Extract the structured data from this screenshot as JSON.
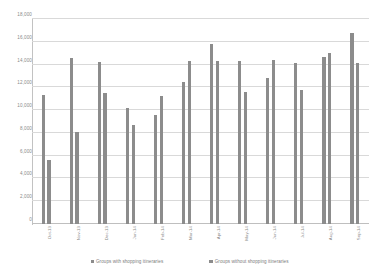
{
  "chart_data": {
    "type": "bar",
    "title": "",
    "xlabel": "",
    "ylabel": "",
    "ylim": [
      0,
      18000
    ],
    "ytick_step": 2000,
    "grid": true,
    "legend_position": "bottom",
    "categories": [
      "Oct-13",
      "Nov-13",
      "Dec-13",
      "Jan-14",
      "Feb-14",
      "Mar-14",
      "Apr-14",
      "May-14",
      "Jun-14",
      "Jul-14",
      "Aug-14",
      "Sep-14"
    ],
    "ytick_labels": [
      "18,000",
      "16,000",
      "14,000",
      "12,000",
      "10,000",
      "8,000",
      "6,000",
      "4,000",
      "2,000",
      "0"
    ],
    "series": [
      {
        "name": "Groups with shopping itineraries",
        "color": "#8c8c8c",
        "values": [
          11300,
          14600,
          14200,
          10200,
          9600,
          12500,
          15800,
          14300,
          12800,
          14100,
          14700,
          16800
        ]
      },
      {
        "name": "Groups without shopping itineraries",
        "color": "#8c8c8c",
        "values": [
          5600,
          8100,
          11500,
          8700,
          11200,
          14300,
          14300,
          11600,
          14400,
          11800,
          15000,
          14100
        ]
      }
    ]
  },
  "legend": {
    "items": [
      {
        "marker": "square-marker",
        "label": "Groups with shopping itineraries"
      },
      {
        "marker": "square-marker",
        "label": "Groups without shopping itineraries"
      }
    ]
  }
}
